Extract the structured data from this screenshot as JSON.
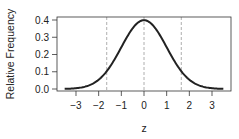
{
  "chart_data": {
    "type": "line",
    "title": "",
    "xlabel": "z",
    "ylabel": "Relative Frequency",
    "xlim": [
      -3.5,
      3.5
    ],
    "ylim": [
      0,
      0.4
    ],
    "x_ticks": [
      "−3",
      "−2",
      "−1",
      "0",
      "1",
      "2",
      "3"
    ],
    "x_tick_values": [
      -3,
      -2,
      -1,
      0,
      1,
      2,
      3
    ],
    "y_ticks": [
      "0.0",
      "0.1",
      "0.2",
      "0.3",
      "0.4"
    ],
    "y_tick_values": [
      0,
      0.1,
      0.2,
      0.3,
      0.4
    ],
    "grid": false,
    "legend": null,
    "series": [
      {
        "name": "Standard normal density",
        "x": [
          -3.5,
          -3,
          -2.5,
          -2,
          -1.5,
          -1,
          -0.5,
          0,
          0.5,
          1,
          1.5,
          2,
          2.5,
          3,
          3.5
        ],
        "values": [
          0.0009,
          0.0044,
          0.0175,
          0.054,
          0.1295,
          0.242,
          0.3521,
          0.3989,
          0.3521,
          0.242,
          0.1295,
          0.054,
          0.0175,
          0.0044,
          0.0009
        ],
        "color": "#222222"
      }
    ],
    "annotations": [
      {
        "type": "vline",
        "x": -1.645,
        "style": "dashed",
        "color": "#9a9a9a"
      },
      {
        "type": "vline",
        "x": 0,
        "style": "dashed",
        "color": "#9a9a9a"
      },
      {
        "type": "vline",
        "x": 1.645,
        "style": "dashed",
        "color": "#9a9a9a"
      }
    ]
  }
}
